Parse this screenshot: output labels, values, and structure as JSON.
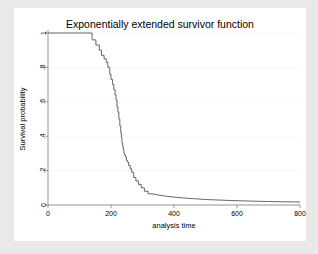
{
  "figure": {
    "background_color": "#ffffff",
    "outer_background_color": "#e9e9e9"
  },
  "chart_data": {
    "type": "line",
    "title": "Exponentially extended survivor function",
    "xlabel": "analysis time",
    "ylabel": "Survival probability",
    "xlim": [
      0,
      800
    ],
    "ylim": [
      0,
      1
    ],
    "xticks": [
      0,
      200,
      400,
      600,
      800
    ],
    "xtick_labels": [
      "0",
      "200",
      "400",
      "600",
      "800"
    ],
    "yticks": [
      0,
      0.2,
      0.4,
      0.6,
      0.8,
      1
    ],
    "ytick_labels": [
      "0",
      ".2",
      ".4",
      ".6",
      ".8",
      "1"
    ],
    "grid": true,
    "grid_axis": "y",
    "legend": "none",
    "line_color": "#4a4a4a",
    "series": [
      {
        "name": "Survivor function (Kaplan-Meier step, exponentially extended tail)",
        "step_type": "post",
        "x": [
          0,
          140,
          140,
          152,
          152,
          163,
          163,
          170,
          170,
          178,
          178,
          185,
          185,
          190,
          190,
          196,
          196,
          200,
          200,
          205,
          205,
          209,
          209,
          213,
          213,
          216,
          216,
          219,
          219,
          222,
          222,
          225,
          225,
          228,
          228,
          231,
          231,
          233,
          233,
          235,
          235,
          237,
          237,
          239,
          239,
          241,
          241,
          243,
          243,
          246,
          246,
          249,
          249,
          252,
          252,
          256,
          256,
          261,
          261,
          266,
          266,
          272,
          272,
          279,
          279,
          287,
          287,
          296,
          296,
          306,
          306,
          318,
          318,
          330
        ],
        "y": [
          1,
          1,
          0.96,
          0.96,
          0.93,
          0.93,
          0.9,
          0.9,
          0.87,
          0.87,
          0.85,
          0.85,
          0.83,
          0.83,
          0.8,
          0.8,
          0.76,
          0.76,
          0.73,
          0.73,
          0.7,
          0.7,
          0.67,
          0.67,
          0.64,
          0.64,
          0.61,
          0.61,
          0.57,
          0.57,
          0.54,
          0.54,
          0.5,
          0.5,
          0.46,
          0.46,
          0.42,
          0.42,
          0.39,
          0.39,
          0.36,
          0.36,
          0.34,
          0.34,
          0.32,
          0.32,
          0.3,
          0.3,
          0.29,
          0.29,
          0.28,
          0.28,
          0.26,
          0.26,
          0.25,
          0.25,
          0.23,
          0.23,
          0.21,
          0.21,
          0.19,
          0.19,
          0.16,
          0.16,
          0.14,
          0.14,
          0.12,
          0.12,
          0.1,
          0.1,
          0.08,
          0.08,
          0.065,
          0.065
        ]
      },
      {
        "name": "Exponential extension tail",
        "step_type": "smooth",
        "x": [
          330,
          350,
          375,
          400,
          430,
          460,
          500,
          540,
          580,
          620,
          660,
          700,
          740,
          780,
          800
        ],
        "y": [
          0.065,
          0.058,
          0.051,
          0.046,
          0.041,
          0.037,
          0.032,
          0.029,
          0.026,
          0.024,
          0.022,
          0.02,
          0.019,
          0.018,
          0.017
        ]
      }
    ]
  }
}
